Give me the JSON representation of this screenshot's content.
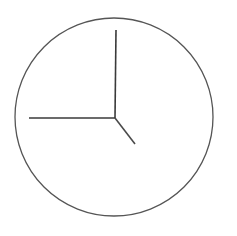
{
  "clock": {
    "face": {
      "cx": 114,
      "cy": 117,
      "r": 99,
      "stroke": "#555555",
      "stroke_width": 1.3,
      "fill": "#ffffff"
    },
    "pivot": {
      "x": 115,
      "y": 118
    },
    "hands": [
      {
        "name": "minute-hand",
        "x2": 116,
        "y2": 30,
        "stroke": "#3a3a3a",
        "width": 1.6,
        "points_to": "12"
      },
      {
        "name": "second-hand",
        "x2": 29,
        "y2": 118,
        "stroke": "#3a3a3a",
        "width": 1.6,
        "points_to": "9"
      },
      {
        "name": "hour-hand",
        "x2": 135,
        "y2": 144,
        "stroke": "#4a4a4a",
        "width": 1.6,
        "points_to": "5"
      }
    ],
    "time_shown": "5:00:45"
  }
}
